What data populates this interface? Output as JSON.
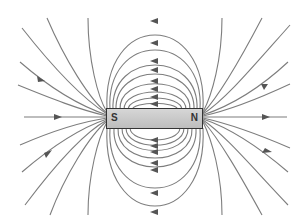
{
  "diagram": {
    "magnet": {
      "left_pole_label": "S",
      "right_pole_label": "N",
      "color": "#c8c8c8",
      "border_color": "#333333"
    },
    "line_color": "#7a7a7a",
    "arrow_direction": "lines leave N, loop around, enter S (arrows point right on outer lines, left on closed loops)"
  }
}
